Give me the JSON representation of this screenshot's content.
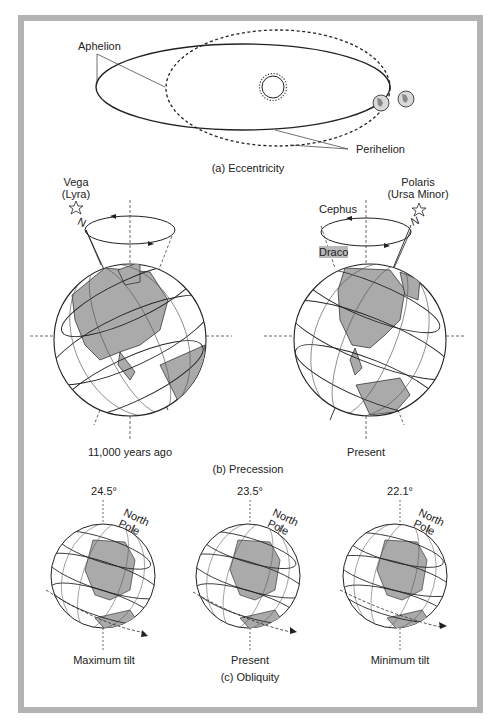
{
  "figure": {
    "sections": {
      "eccentricity": {
        "caption": "(a) Eccentricity",
        "labels": {
          "aphelion": "Aphelion",
          "perihelion": "Perihelion"
        }
      },
      "precession": {
        "caption": "(b) Precession",
        "left": {
          "star_name": "Vega",
          "constellation": "(Lyra)",
          "north": "N",
          "time_label": "11,000 years ago"
        },
        "right": {
          "star_name": "Polaris",
          "constellation": "(Ursa Minor)",
          "north": "N",
          "cephus": "Cephus",
          "draco": "Draco",
          "time_label": "Present"
        }
      },
      "obliquity": {
        "caption": "(c) Obliquity",
        "globes": [
          {
            "angle": "24.5°",
            "pole_line1": "North",
            "pole_line2": "Pole",
            "label": "Maximum tilt"
          },
          {
            "angle": "23.5°",
            "pole_line1": "North",
            "pole_line2": "Pole",
            "label": "Present"
          },
          {
            "angle": "22.1°",
            "pole_line1": "North",
            "pole_line2": "Pole",
            "label": "Minimum tilt"
          }
        ]
      }
    },
    "colors": {
      "frame": "#b3b3b3",
      "land": "#aaaaaa",
      "line": "#222222"
    }
  }
}
